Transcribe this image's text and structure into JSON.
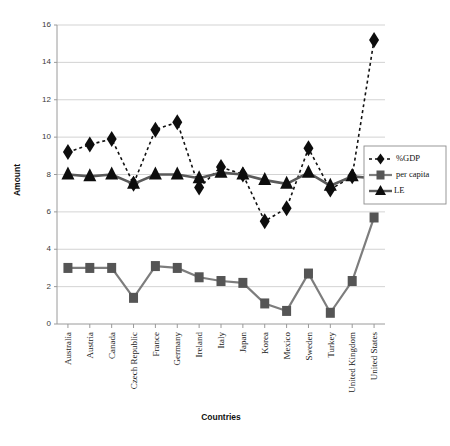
{
  "chart_data": {
    "type": "line",
    "title": "",
    "xlabel": "Countries",
    "ylabel": "Amount",
    "ylim": [
      0,
      16
    ],
    "ytick_step": 2,
    "yticks": [
      "0",
      "2",
      "4",
      "6",
      "8",
      "10",
      "12",
      "14",
      "16"
    ],
    "grid": true,
    "legend_position": "right-middle",
    "categories": [
      "Australia",
      "Austria",
      "Canada",
      "Czech Republic",
      "France",
      "Germany",
      "Ireland",
      "Italy",
      "Japan",
      "Korea",
      "Mexico",
      "Sweden",
      "Turkey",
      "United Kingdom",
      "United States"
    ],
    "series": [
      {
        "name": "%GDP",
        "marker": "diamond",
        "line_style": "dotted",
        "color": "#0d0d0d",
        "values": [
          9.2,
          9.6,
          9.9,
          7.5,
          10.4,
          10.8,
          7.3,
          8.4,
          8.0,
          5.5,
          6.2,
          9.4,
          7.2,
          7.9,
          15.2
        ]
      },
      {
        "name": "per capita",
        "marker": "square",
        "line_style": "solid",
        "color": "#7d7d7d",
        "values": [
          3.0,
          3.0,
          3.0,
          1.4,
          3.1,
          3.0,
          2.5,
          2.3,
          2.2,
          1.1,
          0.7,
          2.7,
          0.6,
          2.3,
          5.7
        ]
      },
      {
        "name": "LE",
        "marker": "triangle",
        "line_style": "solid",
        "color": "#5a5a5a",
        "values": [
          8.0,
          7.9,
          8.0,
          7.5,
          8.0,
          8.0,
          7.8,
          8.1,
          8.0,
          7.7,
          7.5,
          8.1,
          7.4,
          7.9,
          7.8
        ]
      }
    ]
  },
  "legend": {
    "entries": [
      {
        "label": "%GDP"
      },
      {
        "label": "per capita"
      },
      {
        "label": "LE"
      }
    ]
  }
}
